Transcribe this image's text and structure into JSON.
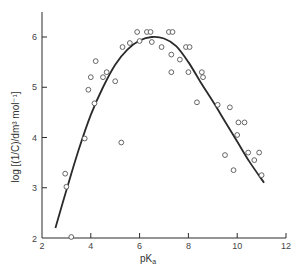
{
  "chart_data": {
    "type": "scatter",
    "title": "",
    "xlabel": "pK_a",
    "ylabel": "log [(1/C)/dm^3 mol^-1]",
    "xlim": [
      2,
      12
    ],
    "ylim": [
      2,
      6.5
    ],
    "xticks": [
      2,
      4,
      6,
      8,
      10,
      12
    ],
    "yticks": [
      3,
      4,
      5,
      6
    ],
    "grid": false,
    "legend": null,
    "series": [
      {
        "name": "observed",
        "marker": "open-circle",
        "points": [
          [
            2.95,
            3.28
          ],
          [
            3.0,
            3.02
          ],
          [
            3.2,
            2.02
          ],
          [
            3.75,
            3.98
          ],
          [
            3.9,
            4.95
          ],
          [
            4.0,
            5.2
          ],
          [
            4.15,
            4.68
          ],
          [
            4.2,
            5.52
          ],
          [
            4.5,
            5.2
          ],
          [
            4.65,
            5.3
          ],
          [
            5.0,
            5.12
          ],
          [
            5.25,
            3.9
          ],
          [
            5.3,
            5.8
          ],
          [
            5.6,
            5.88
          ],
          [
            5.9,
            6.1
          ],
          [
            6.0,
            5.92
          ],
          [
            6.3,
            6.1
          ],
          [
            6.45,
            6.1
          ],
          [
            6.5,
            5.9
          ],
          [
            6.9,
            5.8
          ],
          [
            7.2,
            6.1
          ],
          [
            7.35,
            6.1
          ],
          [
            7.3,
            5.65
          ],
          [
            7.3,
            5.3
          ],
          [
            7.65,
            5.55
          ],
          [
            7.9,
            5.8
          ],
          [
            8.05,
            5.8
          ],
          [
            8.0,
            5.3
          ],
          [
            8.35,
            4.7
          ],
          [
            8.55,
            5.3
          ],
          [
            8.6,
            5.2
          ],
          [
            9.2,
            4.65
          ],
          [
            9.7,
            4.6
          ],
          [
            9.5,
            3.65
          ],
          [
            9.85,
            3.35
          ],
          [
            10.05,
            4.3
          ],
          [
            10.0,
            4.05
          ],
          [
            10.3,
            4.3
          ],
          [
            10.45,
            3.7
          ],
          [
            10.7,
            3.55
          ],
          [
            10.9,
            3.7
          ],
          [
            11.0,
            3.25
          ]
        ]
      },
      {
        "name": "fitted curve",
        "type": "line",
        "points": [
          [
            2.55,
            2.2
          ],
          [
            3.0,
            2.95
          ],
          [
            3.5,
            3.75
          ],
          [
            4.0,
            4.45
          ],
          [
            4.5,
            5.0
          ],
          [
            5.0,
            5.45
          ],
          [
            5.5,
            5.75
          ],
          [
            6.0,
            5.93
          ],
          [
            6.5,
            6.0
          ],
          [
            7.0,
            5.97
          ],
          [
            7.5,
            5.82
          ],
          [
            8.0,
            5.5
          ],
          [
            8.5,
            5.1
          ],
          [
            9.0,
            4.72
          ],
          [
            9.5,
            4.32
          ],
          [
            10.0,
            3.92
          ],
          [
            10.5,
            3.52
          ],
          [
            11.1,
            3.1
          ]
        ]
      }
    ]
  },
  "axes": {
    "x_tick_labels": [
      "2",
      "4",
      "6",
      "8",
      "10",
      "12"
    ],
    "y_tick_labels": [
      "3",
      "4",
      "5",
      "6"
    ],
    "x_title": "pK",
    "x_title_sub": "a",
    "y_title": "log [(1/C)/dm³ mol⁻¹]"
  },
  "colors": {
    "ink": "#2a2a2a",
    "marker": "#555555",
    "text": "#444444"
  }
}
